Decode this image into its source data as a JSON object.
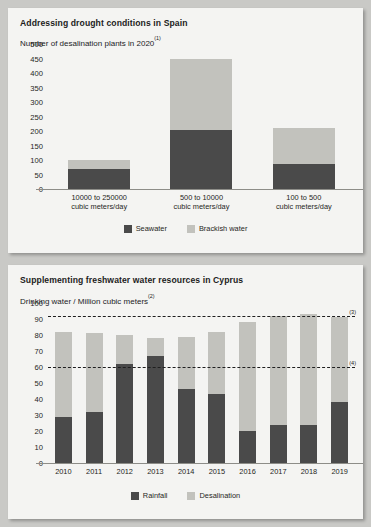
{
  "chart_data": [
    {
      "id": "spain",
      "type": "bar",
      "stacked": true,
      "title": "Addressing drought conditions in Spain",
      "subtitle": "Number of desalination plants in 2020",
      "subtitle_footnote": "(1)",
      "xlabel": "",
      "ylabel": "",
      "ylim": [
        0,
        500
      ],
      "yticks": [
        500,
        450,
        400,
        350,
        300,
        250,
        200,
        150,
        100,
        50,
        0
      ],
      "grid": false,
      "legend_position": "bottom",
      "categories": [
        "10000 to 250000 cubic meters/day",
        "500 to 10000 cubic meters/day",
        "100 to 500 cubic meters/day"
      ],
      "category_lines": [
        [
          "10000 to 250000",
          "cubic meters/day"
        ],
        [
          "500 to 10000",
          "cubic meters/day"
        ],
        [
          "100 to 500",
          "cubic meters/day"
        ]
      ],
      "series": [
        {
          "name": "Seawater",
          "color": "#4a4a4a",
          "values": [
            70,
            205,
            85
          ]
        },
        {
          "name": "Brackish water",
          "color": "#c2c2bd",
          "values": [
            30,
            245,
            125
          ]
        }
      ],
      "totals": [
        100,
        450,
        210
      ]
    },
    {
      "id": "cyprus",
      "type": "bar",
      "stacked": true,
      "title": "Supplementing freshwater water resources in Cyprus",
      "subtitle": "Drinking water / Million cubic meters",
      "subtitle_footnote": "(2)",
      "xlabel": "",
      "ylabel": "",
      "ylim": [
        0,
        100
      ],
      "yticks": [
        100,
        90,
        80,
        70,
        60,
        50,
        40,
        30,
        20,
        10,
        0
      ],
      "grid": false,
      "legend_position": "bottom",
      "categories": [
        "2010",
        "2011",
        "2012",
        "2013",
        "2014",
        "2015",
        "2016",
        "2017",
        "2018",
        "2019"
      ],
      "series": [
        {
          "name": "Rainfall",
          "color": "#4a4a4a",
          "values": [
            29,
            32,
            62,
            67,
            46,
            43,
            20,
            24,
            24,
            38
          ]
        },
        {
          "name": "Desalination",
          "color": "#c2c2bd",
          "values": [
            53,
            49,
            18,
            11,
            33,
            39,
            68,
            68,
            69,
            53
          ]
        }
      ],
      "totals": [
        82,
        81,
        80,
        78,
        79,
        82,
        88,
        92,
        93,
        91
      ],
      "reference_lines": [
        {
          "value": 92,
          "label": "(3)"
        },
        {
          "value": 60,
          "label": "(4)"
        }
      ]
    }
  ]
}
